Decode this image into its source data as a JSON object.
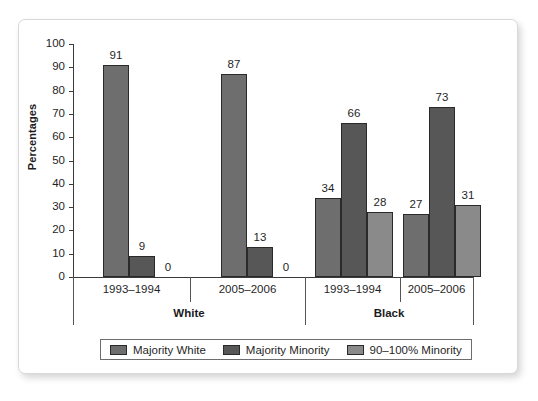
{
  "chart_data": {
    "type": "bar",
    "title": "",
    "xlabel": "",
    "ylabel": "Percentages",
    "ylim": [
      0,
      100
    ],
    "ytick_step": 10,
    "yticks": [
      "100",
      "90",
      "80",
      "70",
      "60",
      "50",
      "40",
      "30",
      "20",
      "10",
      "0"
    ],
    "grid": false,
    "legend_position": "bottom",
    "group_tier1": [
      "1993–1994",
      "2005–2006",
      "1993–1994",
      "2005–2006"
    ],
    "group_tier2": [
      "White",
      "Black"
    ],
    "categories": [
      "White 1993–1994",
      "White 2005–2006",
      "Black 1993–1994",
      "Black 2005–2006"
    ],
    "series": [
      {
        "name": "Majority White",
        "color": "#6e6e6e",
        "values": [
          91,
          87,
          34,
          27
        ]
      },
      {
        "name": "Majority Minority",
        "color": "#575757",
        "values": [
          9,
          13,
          66,
          73
        ]
      },
      {
        "name": "90–100% Minority",
        "color": "#8a8a8a",
        "values": [
          0,
          0,
          28,
          31
        ]
      }
    ]
  },
  "legend": {
    "items": [
      {
        "label": "Majority White",
        "color": "#6e6e6e"
      },
      {
        "label": "Majority Minority",
        "color": "#575757"
      },
      {
        "label": "90–100% Minority",
        "color": "#8a8a8a"
      }
    ]
  },
  "axis": {
    "ylabel": "Percentages"
  }
}
